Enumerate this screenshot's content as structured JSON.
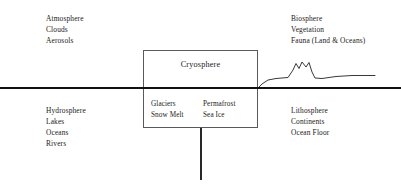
{
  "diagram": {
    "type": "schematic",
    "background_color": "#ffffff",
    "line_color": "#111111",
    "box_border_color": "#555555"
  },
  "labels": {
    "top_left": {
      "name": "atmosphere-labels",
      "lines": [
        "Atmosphere",
        "Clouds",
        "Aerosols"
      ]
    },
    "top_right": {
      "name": "biosphere-labels",
      "lines": [
        "Biosphere",
        "Vegetation",
        "Fauna (Land & Oceans)"
      ]
    },
    "bottom_left": {
      "name": "hydrosphere-labels",
      "lines": [
        "Hydrosphere",
        "Lakes",
        "Oceans",
        "Rivers"
      ]
    },
    "bottom_right": {
      "name": "lithosphere-labels",
      "lines": [
        "Lithosphere",
        "Continents",
        "Ocean Floor"
      ]
    }
  },
  "cryosphere_box": {
    "title": "Cryosphere",
    "left_column": [
      "Glaciers",
      "Snow Melt"
    ],
    "right_column": [
      "Permafrost",
      "Sea Ice"
    ]
  },
  "graphics": {
    "surface_line": "horizontal line across full width at y=88",
    "vertical_divider": "vertical line from box bottom downward at x=201",
    "terrain_profile": "land surface relief with double mountain peak on the right side"
  }
}
